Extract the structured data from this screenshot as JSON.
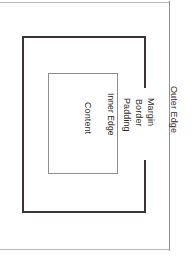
{
  "diagram": {
    "orientation": "rotated-90-clockwise",
    "labels": {
      "outer_edge": "Outer Edge",
      "margin": "Margin",
      "border": "Border",
      "padding": "Padding",
      "inner_edge": "Inner Edge",
      "content": "Content"
    },
    "colors": {
      "page_background": "#ffffff",
      "border_box_stroke": "#3b3335",
      "content_box_stroke": "#8d8d93",
      "outer_frame_stroke": "#b9b9bd",
      "text": "#2f2b2c"
    }
  }
}
